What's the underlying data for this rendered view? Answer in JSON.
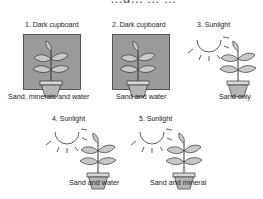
{
  "title": "…g… … …",
  "setups": [
    {
      "number": "1.",
      "condition": "Dark cupboard",
      "label": "1. Dark cupboard",
      "medium": "Sand, minerals and water",
      "light": false
    },
    {
      "number": "2.",
      "condition": "Dark cupboard",
      "label": "2. Dark cupboard",
      "medium": "Sand and water",
      "light": false
    },
    {
      "number": "3.",
      "condition": "Sunlight",
      "label": "3. Sunlight",
      "medium": "Sand only",
      "light": true
    },
    {
      "number": "4.",
      "condition": "Sunlight",
      "label": "4. Sunlight",
      "medium": "Sand and water",
      "light": true
    },
    {
      "number": "5.",
      "condition": "Sunlight",
      "label": "5. Sunlight",
      "medium": "Sand and mineral",
      "light": true
    }
  ],
  "icons": {
    "plant": "potted-plant-icon",
    "sun": "sun-icon",
    "cupboard": "dark-cupboard-box"
  },
  "colors": {
    "cupboard": "#9a9a9a",
    "leaf": "#c8c8c8",
    "pot": "#b5b5b5",
    "line": "#333333"
  }
}
